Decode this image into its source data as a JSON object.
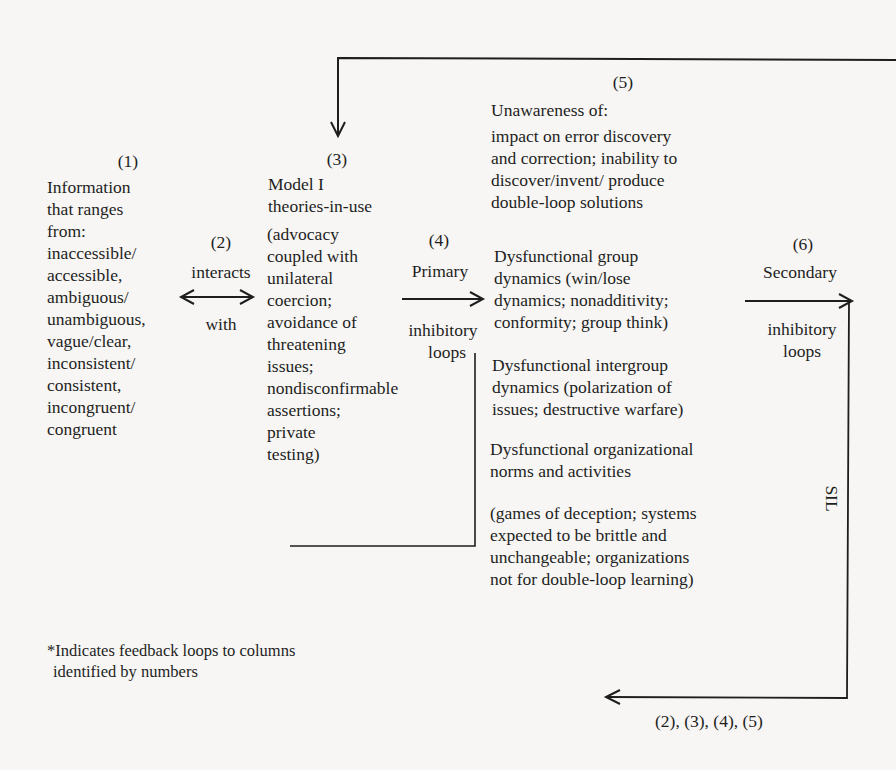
{
  "diagram": {
    "col1": {
      "number": "(1)",
      "lines": [
        "Information",
        "that ranges",
        "from:",
        "inaccessible/",
        "accessible,",
        "ambiguous/",
        "unambiguous,",
        "vague/clear,",
        "inconsistent/",
        "consistent,",
        "incongruent/",
        "congruent"
      ]
    },
    "col2": {
      "number": "(2)",
      "above": "interacts",
      "below": "with"
    },
    "col3": {
      "number": "(3)",
      "title_lines": [
        "Model I",
        "theories-in-use"
      ],
      "lines": [
        "(advocacy",
        "coupled with",
        "unilateral",
        "coercion;",
        "avoidance of",
        "threatening",
        "issues;",
        "nondisconfirmable",
        "assertions;",
        "private",
        "testing)"
      ]
    },
    "col4": {
      "number": "(4)",
      "above": "Primary",
      "below_lines": [
        "inhibitory",
        "loops"
      ]
    },
    "col5": {
      "number": "(5)",
      "heading": "Unawareness of:",
      "block1": [
        "impact on error discovery",
        "and correction; inability to",
        "discover/invent/ produce",
        "double-loop solutions"
      ],
      "block2": [
        "Dysfunctional group",
        "dynamics (win/lose",
        "dynamics; nonadditivity;",
        "conformity; group think)"
      ],
      "block3": [
        "Dysfunctional intergroup",
        "dynamics (polarization of",
        "issues; destructive warfare)"
      ],
      "block4": [
        "Dysfunctional organizational",
        "norms and activities"
      ],
      "block5": [
        "(games of deception; systems",
        "expected to be brittle and",
        "unchangeable; organizations",
        "not for double-loop learning)"
      ]
    },
    "col6": {
      "number": "(6)",
      "above": "Secondary",
      "below_lines": [
        "inhibitory",
        "loops"
      ]
    },
    "sil_label": "SIL",
    "feedback_label": "(2), (3), (4), (5)",
    "footnote_lines": [
      "*Indicates feedback loops to columns",
      "identified by numbers"
    ]
  }
}
